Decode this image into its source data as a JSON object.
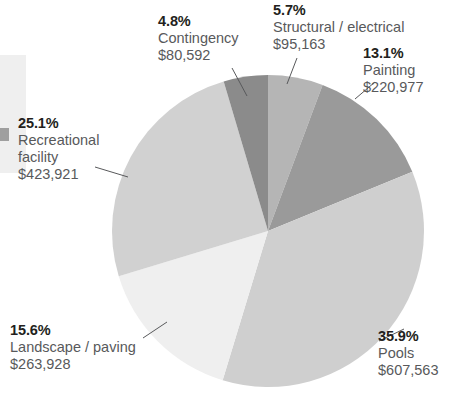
{
  "chart_data": {
    "type": "pie",
    "title": "",
    "subtitle": "",
    "xlabel": "",
    "ylabel": "",
    "legend_position": "labels-with-leader-lines",
    "grid": false,
    "value_prefix": "$",
    "total_value": 1692144,
    "categories": [
      "Structural / electrical",
      "Painting",
      "Pools",
      "Landscape / paving",
      "Recreational facility",
      "Contingency"
    ],
    "values": [
      95163,
      220977,
      607563,
      263928,
      423921,
      80592
    ],
    "percents": [
      5.7,
      13.1,
      35.9,
      15.6,
      25.1,
      4.8
    ],
    "colors": [
      "#b5b5b5",
      "#9a9a9a",
      "#cfcfcf",
      "#efefef",
      "#d1d1d1",
      "#8b8b8b"
    ],
    "slices": [
      {
        "key": "structural",
        "pct_label": "5.7%",
        "name": "Structural / electrical",
        "value_label": "$95,163",
        "percent": 5.7,
        "value": 95163,
        "color": "#b5b5b5",
        "start_angle_deg": 0.0,
        "end_angle_deg": 20.5
      },
      {
        "key": "painting",
        "pct_label": "13.1%",
        "name": "Painting",
        "value_label": "$220,977",
        "percent": 13.1,
        "value": 220977,
        "color": "#9a9a9a",
        "start_angle_deg": 20.5,
        "end_angle_deg": 67.7
      },
      {
        "key": "pools",
        "pct_label": "35.9%",
        "name": "Pools",
        "value_label": "$607,563",
        "percent": 35.9,
        "value": 607563,
        "color": "#cfcfcf",
        "start_angle_deg": 67.7,
        "end_angle_deg": 196.9
      },
      {
        "key": "landscape",
        "pct_label": "15.6%",
        "name": "Landscape / paving",
        "value_label": "$263,928",
        "percent": 15.6,
        "value": 263928,
        "color": "#efefef",
        "start_angle_deg": 196.9,
        "end_angle_deg": 253.1
      },
      {
        "key": "recreational",
        "pct_label": "25.1%",
        "name_line1": "Recreational",
        "name_line2": "facility",
        "name": "Recreational facility",
        "value_label": "$423,921",
        "percent": 25.1,
        "value": 423921,
        "color": "#d1d1d1",
        "start_angle_deg": 253.1,
        "end_angle_deg": 343.5
      },
      {
        "key": "contingency",
        "pct_label": "4.8%",
        "name": "Contingency",
        "value_label": "$80,592",
        "percent": 4.8,
        "value": 80592,
        "color": "#8b8b8b",
        "start_angle_deg": 343.5,
        "end_angle_deg": 360.0
      }
    ],
    "geometry": {
      "center_x": 268,
      "center_y": 231,
      "radius": 156
    }
  }
}
